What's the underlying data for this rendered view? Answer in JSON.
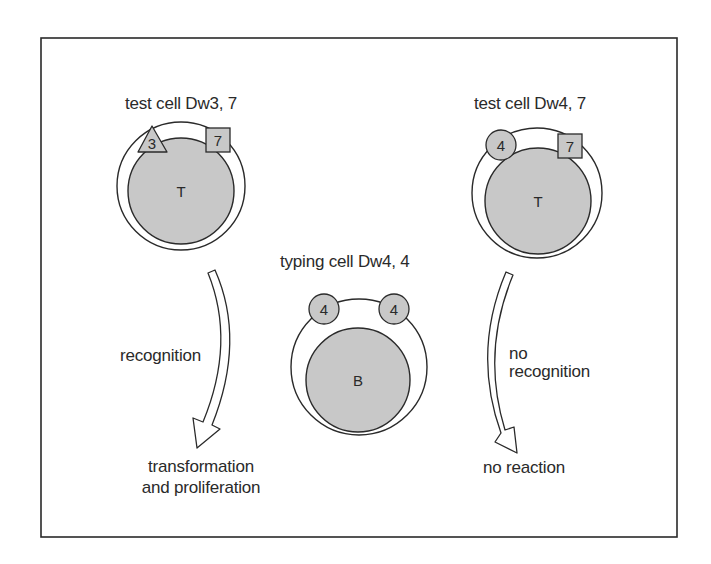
{
  "diagram": {
    "colors": {
      "line": "#2a2a2a",
      "cell_fill": "#c8c8c8",
      "membrane_fill": "#ffffff",
      "background": "#ffffff"
    },
    "test_cell_left": {
      "title": "test cell Dw3, 7",
      "nucleus_label": "T",
      "antigens": [
        {
          "shape": "triangle",
          "label": "3"
        },
        {
          "shape": "square",
          "label": "7"
        }
      ]
    },
    "typing_cell": {
      "title": "typing cell Dw4, 4",
      "nucleus_label": "B",
      "antigens": [
        {
          "shape": "circle",
          "label": "4"
        },
        {
          "shape": "circle",
          "label": "4"
        }
      ]
    },
    "test_cell_right": {
      "title": "test cell Dw4, 7",
      "nucleus_label": "T",
      "antigens": [
        {
          "shape": "circle",
          "label": "4"
        },
        {
          "shape": "square",
          "label": "7"
        }
      ]
    },
    "left_arrow": {
      "label": "recognition",
      "outcome_line1": "transformation",
      "outcome_line2": "and proliferation"
    },
    "right_arrow": {
      "label_line1": "no",
      "label_line2": "recognition",
      "outcome": "no reaction"
    }
  }
}
